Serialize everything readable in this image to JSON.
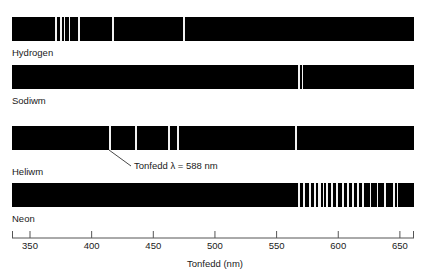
{
  "chart_data": {
    "type": "line",
    "title": "",
    "xlabel": "Tonfedd (nm)",
    "ylabel": "",
    "xlim": [
      341,
      655
    ],
    "grid": false,
    "legend": "none",
    "axis": {
      "label": "Tonfedd (nm)",
      "ticks": [
        350,
        400,
        450,
        500,
        550,
        600,
        650
      ],
      "tick_labels": [
        "350",
        "400",
        "450",
        "500",
        "550",
        "600",
        "650"
      ],
      "min": 341,
      "max": 655
    },
    "series": [
      {
        "name": "Hydrogen",
        "label": "Hydrogen",
        "band_color": "#000000",
        "line_color": "#f2f2f2",
        "lines_nm": [
          371,
          375,
          378,
          382,
          390,
          417,
          475
        ],
        "line_widths_nm": [
          1.2,
          1.2,
          1.2,
          1.2,
          1.6,
          1.6,
          1.6
        ]
      },
      {
        "name": "Sodiwm",
        "label": "Sodiwm",
        "band_color": "#000000",
        "line_color": "#f2f2f2",
        "lines_nm": [
          568,
          571
        ],
        "line_widths_nm": [
          1.6,
          1.6
        ]
      },
      {
        "name": "Heliwm",
        "label": "Heliwm",
        "band_color": "#000000",
        "line_color": "#f2f2f2",
        "lines_nm": [
          415,
          436,
          463,
          470,
          566
        ],
        "line_widths_nm": [
          1.4,
          1.4,
          1.4,
          1.4,
          1.6
        ]
      },
      {
        "name": "Neon",
        "label": "Neon",
        "band_color": "#000000",
        "line_color": "#f2f2f2",
        "lines_nm": [
          568,
          572,
          577,
          581,
          585,
          588,
          591,
          595,
          599,
          604,
          608,
          612,
          616,
          620,
          626,
          632,
          638,
          645,
          648
        ],
        "line_widths_nm": [
          1.3,
          1.3,
          1.3,
          1.3,
          2.2,
          1.3,
          1.6,
          1.3,
          1.3,
          1.6,
          1.3,
          1.3,
          1.6,
          1.3,
          1.0,
          1.0,
          1.3,
          1.3,
          1.0
        ]
      }
    ],
    "annotations": [
      {
        "text": "Tonfedd λ = 588 nm",
        "points_to_series": "Heliwm",
        "points_to_nm": 415
      }
    ]
  },
  "labels": {
    "hydrogen": "Hydrogen",
    "sodiwm": "Sodiwm",
    "heliwm": "Heliwm",
    "neon": "Neon"
  },
  "annotation": {
    "callout": "Tonfedd λ = 588 nm"
  },
  "axis": {
    "title": "Tonfedd (nm)",
    "t350": "350",
    "t400": "400",
    "t450": "450",
    "t500": "500",
    "t550": "550",
    "t600": "600",
    "t650": "650"
  }
}
